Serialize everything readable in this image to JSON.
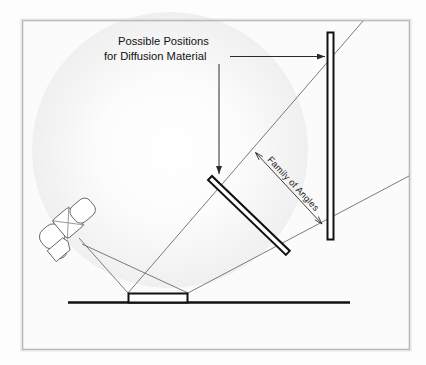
{
  "figure": {
    "kind": "optical-setup-diagram",
    "background_color": "#fdfdfd",
    "frame_border_color": "#b9b9b9",
    "line_color": "#3a3a3a",
    "solid_color": "#111111",
    "glow_color": "#f2f2f2"
  },
  "labels": {
    "callout_line1": "Possible Positions",
    "callout_line2": "for Diffusion Material",
    "family_of_angles": "Family of Angles"
  },
  "elements": {
    "projector_name": "projector",
    "ground_name": "ground-line",
    "platform_name": "sample-platform",
    "tilted_panel_name": "tilted-diffusion-panel",
    "vertical_panel_name": "vertical-diffusion-panel"
  },
  "geometry": {
    "frame": {
      "x": 22,
      "y": 20,
      "w": 388,
      "h": 330
    },
    "glow": {
      "cx": 170,
      "cy": 150,
      "r": 135
    },
    "ground": {
      "x1": 68,
      "y1": 302,
      "x2": 350,
      "y2": 302
    },
    "platform": {
      "x": 128,
      "y": 293,
      "w": 60,
      "h": 9
    },
    "vertical_panel": {
      "x": 327,
      "y": 32,
      "w": 7,
      "h": 208
    },
    "tilted_panel": {
      "x1": 210,
      "y1": 178,
      "x2": 288,
      "y2": 253,
      "thickness": 5
    },
    "projector": {
      "cx": 62,
      "cy": 228,
      "rotation_deg": -38
    },
    "rays": [
      {
        "name": "emit-left",
        "x1": 78,
        "y1": 239,
        "x2": 128,
        "y2": 293
      },
      {
        "name": "emit-right",
        "x1": 80,
        "y1": 243,
        "x2": 188,
        "y2": 293
      },
      {
        "name": "reflect-upper",
        "x1": 128,
        "y1": 293,
        "x2": 362,
        "y2": 21
      },
      {
        "name": "reflect-lower",
        "x1": 188,
        "y1": 293,
        "x2": 410,
        "y2": 175
      }
    ],
    "callout_arrow_vertical": {
      "x": 219,
      "y1": 57,
      "y2": 177
    },
    "callout_arrow_horizontal": {
      "y": 57,
      "x1": 228,
      "x2": 330
    },
    "angle_arrow": {
      "x1": 255,
      "y1": 152,
      "x2": 320,
      "y2": 222
    }
  }
}
